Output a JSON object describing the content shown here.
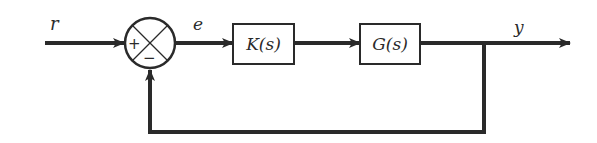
{
  "diagram": {
    "type": "feedback-control-block-diagram",
    "signals": {
      "reference": "r",
      "error": "e",
      "output": "y"
    },
    "summing_junction": {
      "plus_sign": "+",
      "minus_sign": "−"
    },
    "blocks": [
      {
        "id": "controller",
        "label": "K(s)"
      },
      {
        "id": "plant",
        "label": "G(s)"
      }
    ],
    "colors": {
      "line": "#2a2a2a",
      "background": "#ffffff"
    }
  }
}
